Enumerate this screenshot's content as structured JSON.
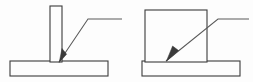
{
  "figure": {
    "background_color": "#fdfdfd",
    "line_color": "#3b3b3b",
    "leader_color": "#5a5a5a",
    "width": 253,
    "height": 82
  },
  "diagrams": [
    {
      "id": "left-tee-joint",
      "name": "Tee joint with thin vertical plate",
      "label": "",
      "upright_member": {
        "name": "vertical-plate",
        "x": 50,
        "y": 6,
        "width": 12,
        "height": 56
      },
      "base_member": {
        "name": "base-plate",
        "x": 10,
        "y": 61,
        "width": 98,
        "height": 15
      },
      "leader": {
        "name": "leader-line",
        "arrow_tip_x": 59,
        "arrow_tip_y": 62,
        "bend_x": 88,
        "bend_y": 19,
        "tail_x": 122,
        "tail_y": 19
      }
    },
    {
      "id": "right-tee-joint",
      "name": "Tee joint with thick upright block",
      "label": "",
      "upright_member": {
        "name": "upright-block",
        "x": 145,
        "y": 10,
        "width": 62,
        "height": 52
      },
      "base_member": {
        "name": "base-plate",
        "x": 142,
        "y": 61,
        "width": 98,
        "height": 15
      },
      "leader": {
        "name": "leader-line",
        "arrow_tip_x": 166,
        "arrow_tip_y": 61,
        "bend_x": 218,
        "bend_y": 19,
        "tail_x": 249,
        "tail_y": 19
      }
    }
  ]
}
